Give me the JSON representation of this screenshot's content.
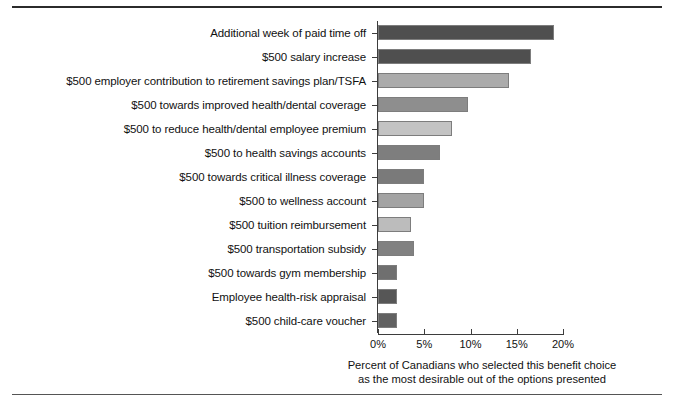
{
  "figure": {
    "clipped_title": "",
    "caption_line1": "Percent of Canadians who selected this benefit choice",
    "caption_line2": "as the most desirable out of the options presented"
  },
  "chart_data": {
    "type": "bar",
    "orientation": "horizontal",
    "title": "",
    "xlabel": "Percent of Canadians who selected this benefit choice as the most desirable out of the options presented",
    "ylabel": "",
    "xlim": [
      0,
      20
    ],
    "grid": false,
    "legend": null,
    "tick_labels": [
      "0%",
      "5%",
      "10%",
      "15%",
      "20%"
    ],
    "tick_values": [
      0,
      5,
      10,
      15,
      20
    ],
    "categories": [
      "Additional week of paid time off",
      "$500 salary increase",
      "$500 employer contribution to retirement savings plan/TSFA",
      "$500 towards improved health/dental coverage",
      "$500 to reduce health/dental employee premium",
      "$500 to health savings accounts",
      "$500 towards critical illness coverage",
      "$500 to wellness account",
      "$500 tuition reimbursement",
      "$500 transportation subsidy",
      "$500 towards gym membership",
      "Employee health-risk appraisal",
      "$500 child-care voucher"
    ],
    "values": [
      19.0,
      16.5,
      14.2,
      9.7,
      8.0,
      6.7,
      5.0,
      5.0,
      3.6,
      3.9,
      2.1,
      2.1,
      2.1
    ],
    "bar_colors": [
      "#4f4f4f",
      "#4f4f4f",
      "#ababab",
      "#8e8e8e",
      "#c3c3c3",
      "#7e7e7e",
      "#7a7a7a",
      "#a3a3a3",
      "#bcbcbc",
      "#818181",
      "#6f6f6f",
      "#565656",
      "#616161"
    ]
  }
}
